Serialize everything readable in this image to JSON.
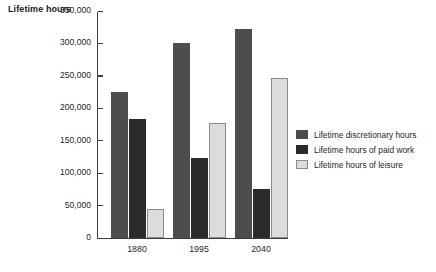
{
  "chart_data": {
    "type": "bar",
    "title": "",
    "ylabel": "Lifetime hours",
    "xlabel": "",
    "categories": [
      "1880",
      "1995",
      "2040"
    ],
    "series": [
      {
        "name": "Lifetime discretionary hours",
        "color": "#4d4d4d",
        "values": [
          225000,
          300000,
          322000
        ]
      },
      {
        "name": "Lifetime hours of paid work",
        "color": "#2b2b2b",
        "values": [
          183000,
          123000,
          76000
        ]
      },
      {
        "name": "Lifetime hours of leisure",
        "color": "#dcdcdc",
        "values": [
          44000,
          178000,
          247000
        ]
      }
    ],
    "ylim": [
      0,
      350000
    ],
    "yticks": [
      0,
      50000,
      100000,
      150000,
      200000,
      250000,
      300000,
      350000
    ],
    "ytick_labels": [
      "0",
      "50,000",
      "100,000",
      "150,000",
      "200,000",
      "250,000",
      "300,000",
      "350,000"
    ],
    "grid": false,
    "legend_position": "right"
  }
}
